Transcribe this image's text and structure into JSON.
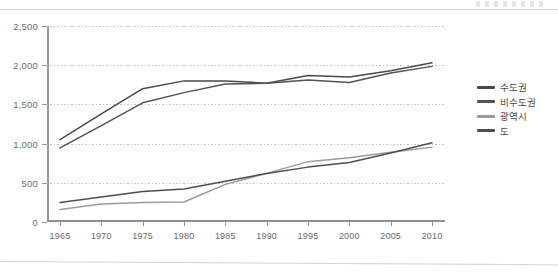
{
  "chart_data": {
    "type": "line",
    "title": "",
    "xlabel": "",
    "ylabel": "",
    "x": [
      1965,
      1970,
      1975,
      1980,
      1985,
      1990,
      1995,
      2000,
      2005,
      2010
    ],
    "xticklabels": [
      "1965",
      "1970",
      "1975",
      "1980",
      "1985",
      "1990",
      "1995",
      "2000",
      "2005",
      "2010"
    ],
    "yticklabels": [
      "0",
      "500",
      "1,000",
      "1,500",
      "2,000",
      "2,500"
    ],
    "yticks": [
      0,
      500,
      1000,
      1500,
      2000,
      2500
    ],
    "ylim": [
      0,
      2500
    ],
    "grid": "horizontal-dotted",
    "legend_position": "right",
    "series": [
      {
        "name": "수도권",
        "color": "#4a4a4a",
        "values": [
          1050,
          1380,
          1700,
          1800,
          1800,
          1770,
          1870,
          1850,
          1930,
          2030
        ]
      },
      {
        "name": "비수도권",
        "color": "#545454",
        "values": [
          945,
          1230,
          1520,
          1650,
          1760,
          1770,
          1810,
          1780,
          1900,
          1985
        ]
      },
      {
        "name": "광역시",
        "color": "#9b9b9b",
        "values": [
          160,
          230,
          250,
          255,
          480,
          620,
          770,
          820,
          890,
          955
        ]
      },
      {
        "name": "도",
        "color": "#4f4f4f",
        "values": [
          250,
          320,
          390,
          420,
          520,
          620,
          700,
          760,
          880,
          1010
        ]
      }
    ]
  },
  "legend": {
    "items": [
      {
        "label": "수도권",
        "color": "#4a4a4a"
      },
      {
        "label": "비수도권",
        "color": "#545454"
      },
      {
        "label": "광역시",
        "color": "#9b9b9b"
      },
      {
        "label": "도",
        "color": "#4f4f4f"
      }
    ]
  }
}
